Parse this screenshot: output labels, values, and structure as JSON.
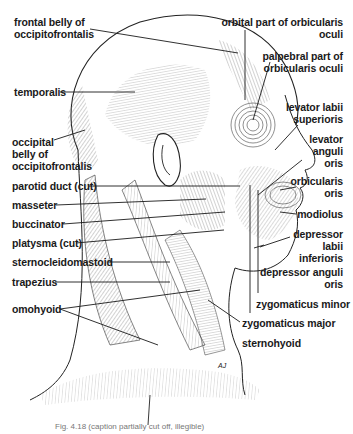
{
  "figure": {
    "caption_visible": "Fig. 4.18 (caption partially cut off, illegible)",
    "artist_initials": "AJ"
  },
  "labels_left": [
    {
      "id": "frontal-belly",
      "lines": [
        "frontal belly of",
        "occipitofrontalis"
      ]
    },
    {
      "id": "temporalis",
      "lines": [
        "temporalis"
      ]
    },
    {
      "id": "occipital-belly",
      "lines": [
        "occipital",
        "belly of",
        "occipitofrontalis"
      ]
    },
    {
      "id": "parotid-duct",
      "lines": [
        "parotid duct (cut)"
      ]
    },
    {
      "id": "masseter",
      "lines": [
        "masseter"
      ]
    },
    {
      "id": "buccinator",
      "lines": [
        "buccinator"
      ]
    },
    {
      "id": "platysma",
      "lines": [
        "platysma (cut)"
      ]
    },
    {
      "id": "sternocleidomastoid",
      "lines": [
        "sternocleidomastoid"
      ]
    },
    {
      "id": "trapezius",
      "lines": [
        "trapezius"
      ]
    },
    {
      "id": "omohyoid",
      "lines": [
        "omohyoid"
      ]
    }
  ],
  "labels_right": [
    {
      "id": "orbital-part",
      "lines": [
        "orbital part of orbicularis",
        "oculi"
      ]
    },
    {
      "id": "palpebral-part",
      "lines": [
        "palpebral part of",
        "orbicularis oculi"
      ]
    },
    {
      "id": "levator-labii",
      "lines": [
        "levator labii",
        "superioris"
      ]
    },
    {
      "id": "levator-anguli",
      "lines": [
        "levator",
        "anguli",
        "oris"
      ]
    },
    {
      "id": "orbicularis-oris",
      "lines": [
        "orbicularis",
        "oris"
      ]
    },
    {
      "id": "modiolus",
      "lines": [
        "modiolus"
      ]
    },
    {
      "id": "depressor-labii",
      "lines": [
        "depressor",
        "labii",
        "inferioris"
      ]
    },
    {
      "id": "depressor-anguli",
      "lines": [
        "depressor anguli",
        "oris"
      ]
    },
    {
      "id": "zygomaticus-minor",
      "lines": [
        "zygomaticus minor"
      ]
    },
    {
      "id": "zygomaticus-major",
      "lines": [
        "zygomaticus major"
      ]
    },
    {
      "id": "sternohyoid",
      "lines": [
        "sternohyoid"
      ]
    }
  ],
  "colors": {
    "ink": "#1a1a1a",
    "hatch": "#555555",
    "background": "#ffffff"
  }
}
